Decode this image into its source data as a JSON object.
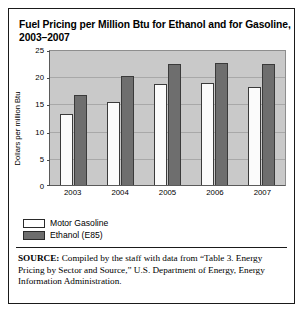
{
  "figure": {
    "title_lines": [
      "Fuel Pricing per Million Btu for Ethanol and for Gasoline,",
      "2003–2007"
    ],
    "source_label": "SOURCE:",
    "source_text": " Compiled by the staff with data from “Table 3. Energy Pricing by Sector and Source,” U.S. Department of Energy, Energy Information Administration."
  },
  "legend": {
    "items": [
      {
        "label": "Motor Gasoline",
        "color": "#ffffff"
      },
      {
        "label": "Ethanol (E85)",
        "color": "#6e6e6e"
      }
    ]
  },
  "chart_data": {
    "type": "bar",
    "title": "Fuel Pricing per Million Btu for Ethanol and for Gasoline, 2003–2007",
    "xlabel": "",
    "ylabel": "Dollars per million Btu",
    "categories": [
      "2003",
      "2004",
      "2005",
      "2006",
      "2007"
    ],
    "series": [
      {
        "name": "Motor Gasoline",
        "color": "#ffffff",
        "values": [
          13.0,
          15.2,
          18.5,
          18.7,
          18.1
        ]
      },
      {
        "name": "Ethanol (E85)",
        "color": "#6e6e6e",
        "values": [
          16.5,
          20.0,
          22.3,
          22.4,
          22.2
        ]
      }
    ],
    "ylim": [
      0,
      25
    ],
    "yticks": [
      0,
      5,
      10,
      15,
      20,
      25
    ],
    "grid": true,
    "legend_position": "below-left",
    "plot_background": "#c9c9c9"
  }
}
